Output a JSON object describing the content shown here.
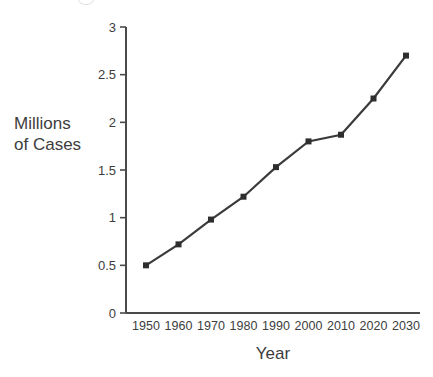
{
  "chart_data": {
    "type": "line",
    "title": "",
    "xlabel": "Year",
    "ylabel": "Millions\nof Cases",
    "ylabel_lines": [
      "Millions",
      "of Cases"
    ],
    "categories": [
      "1950",
      "1960",
      "1970",
      "1980",
      "1990",
      "2000",
      "2010",
      "2020",
      "2030"
    ],
    "x": [
      1950,
      1960,
      1970,
      1980,
      1990,
      2000,
      2010,
      2020,
      2030
    ],
    "values": [
      0.5,
      0.72,
      0.98,
      1.22,
      1.53,
      1.8,
      1.87,
      2.25,
      2.7
    ],
    "series": [
      {
        "name": "Millions of Cases",
        "values": [
          0.5,
          0.72,
          0.98,
          1.22,
          1.53,
          1.8,
          1.87,
          2.25,
          2.7
        ]
      }
    ],
    "ylim": [
      0,
      3
    ],
    "yticks": [
      0,
      0.5,
      1,
      1.5,
      2,
      2.5,
      3
    ],
    "ytick_labels": [
      "0",
      "0.5",
      "1",
      "1.5",
      "2",
      "2.5",
      "3"
    ],
    "xtick_labels": [
      "1950",
      "1960",
      "1970",
      "1980",
      "1990",
      "2000",
      "2010",
      "2020",
      "2030"
    ],
    "grid": false,
    "legend": false,
    "legend_position": "none",
    "marker": "square",
    "line_color": "#3b3b3b",
    "marker_color": "#2e2e2e",
    "axis_color": "#4a4a4a",
    "background_color": "#ffffff"
  },
  "axes": {
    "y_title_line1": "Millions",
    "y_title_line2": "of Cases",
    "x_title": "Year"
  }
}
